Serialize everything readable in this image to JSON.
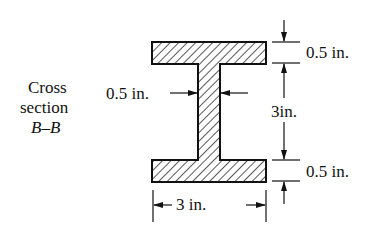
{
  "diagram": {
    "side_label": {
      "line1": "Cross",
      "line2": "section",
      "line3": "B–B"
    },
    "dimensions": {
      "top_flange_thickness": "0.5 in.",
      "web_height": "3in.",
      "bottom_flange_thickness": "0.5 in.",
      "web_thickness": "0.5 in.",
      "flange_width": "3 in."
    },
    "colors": {
      "ink": "#111111",
      "background": "#ffffff"
    }
  }
}
